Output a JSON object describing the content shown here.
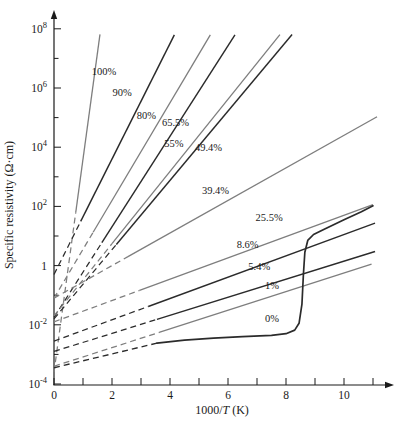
{
  "figure": {
    "background": "#ffffff",
    "axis_color": "#1a1a1a",
    "black_line_color": "#2b2b2b",
    "gray_line_color": "#7e7e7e",
    "label_color": "#1a1a1a"
  },
  "chart_data": {
    "type": "line",
    "title": "",
    "xlabel_parts": {
      "pre": "1000/",
      "italic": "T",
      "post": " (K)"
    },
    "ylabel": "Specific resistivity (Ω·cm)",
    "x_axis": {
      "range": [
        0,
        11.6
      ],
      "labeled_ticks": [
        0,
        2,
        4,
        6,
        8,
        10
      ],
      "minor_ticks": [
        1,
        3,
        5,
        7,
        9,
        11
      ],
      "arrow": true
    },
    "y_axis": {
      "scale": "log10",
      "range_log10": [
        -4,
        8
      ],
      "labeled_ticks": [
        {
          "log10": 8,
          "mantissa": "10",
          "exp": "8"
        },
        {
          "log10": 6,
          "mantissa": "10",
          "exp": "6"
        },
        {
          "log10": 4,
          "mantissa": "10",
          "exp": "4"
        },
        {
          "log10": 2,
          "mantissa": "10",
          "exp": "2"
        },
        {
          "log10": 0,
          "mantissa": "1",
          "exp": ""
        },
        {
          "log10": -2,
          "mantissa": "10",
          "exp": "-2"
        },
        {
          "log10": -4,
          "mantissa": "10",
          "exp": "-4"
        }
      ],
      "minor_ticks_log10": [
        7,
        5,
        3,
        1,
        -1,
        -3
      ],
      "arrow": true
    },
    "series_note": "Arrhenius lines: log10(rho) = intercept_log10 + slope_dec_per_unit * x ; dashed extrapolation from x=0 to solid_from_x, solid from solid_from_x to end_x",
    "series": [
      {
        "name": "100%",
        "intercept_log10": -3.6,
        "slope_dec_per_unit": 7.2,
        "solid_from_x": 0.75,
        "end_x": 1.585,
        "shade": "gray",
        "label": "100%",
        "label_x": 1.3,
        "label_log10": 6.45
      },
      {
        "name": "90%",
        "intercept_log10": -0.3,
        "slope_dec_per_unit": 1.95,
        "solid_from_x": 0.92,
        "end_x": 4.15,
        "shade": "black",
        "label": "90%",
        "label_x": 2.02,
        "label_log10": 5.72
      },
      {
        "name": "80%",
        "intercept_log10": -1.1,
        "slope_dec_per_unit": 1.65,
        "solid_from_x": 1.35,
        "end_x": 5.39,
        "shade": "gray",
        "label": "80%",
        "label_x": 2.85,
        "label_log10": 4.95
      },
      {
        "name": "65.5%",
        "intercept_log10": -1.75,
        "slope_dec_per_unit": 1.53,
        "solid_from_x": 1.65,
        "end_x": 6.24,
        "shade": "black",
        "label": "65.5%",
        "label_x": 3.72,
        "label_log10": 4.7
      },
      {
        "name": "55%",
        "intercept_log10": -1.7,
        "slope_dec_per_unit": 1.22,
        "solid_from_x": 2.0,
        "end_x": 7.79,
        "shade": "gray",
        "label": "55%",
        "label_x": 3.8,
        "label_log10": 4.02
      },
      {
        "name": "49.4%",
        "intercept_log10": -1.8,
        "slope_dec_per_unit": 1.17,
        "solid_from_x": 2.15,
        "end_x": 8.21,
        "shade": "black",
        "label": "49.4%",
        "label_x": 4.86,
        "label_log10": 3.88
      },
      {
        "name": "39.4%",
        "intercept_log10": -1.1,
        "slope_dec_per_unit": 0.55,
        "solid_from_x": 2.55,
        "end_x": 11.14,
        "shade": "gray",
        "label": "39.4%",
        "label_x": 5.1,
        "label_log10": 2.42
      },
      {
        "name": "25.5%",
        "intercept_log10": -1.9,
        "slope_dec_per_unit": 0.36,
        "solid_from_x": 2.95,
        "end_x": 11.0,
        "shade": "gray",
        "label": "25.5%",
        "label_x": 6.95,
        "label_log10": 1.5
      },
      {
        "name": "8.6%",
        "intercept_log10": -2.55,
        "slope_dec_per_unit": 0.36,
        "solid_from_x": 3.25,
        "end_x": 11.07,
        "shade": "black",
        "label": "8.6%",
        "label_x": 6.3,
        "label_log10": 0.6
      },
      {
        "name": "5.4%",
        "intercept_log10": -2.9,
        "slope_dec_per_unit": 0.305,
        "solid_from_x": 3.55,
        "end_x": 11.07,
        "shade": "black",
        "label": "5.4%",
        "label_x": 6.7,
        "label_log10": -0.15
      },
      {
        "name": "1%",
        "intercept_log10": -3.4,
        "slope_dec_per_unit": 0.315,
        "solid_from_x": 3.65,
        "end_x": 10.95,
        "shade": "gray",
        "label": "1%",
        "label_x": 7.28,
        "label_log10": -0.78
      }
    ],
    "curve_0pct": {
      "name": "0%",
      "label": "0%",
      "label_x": 7.28,
      "label_log10": -1.92,
      "shade": "black",
      "dashed_points": [
        [
          0,
          -3.45
        ],
        [
          3.55,
          -2.62
        ]
      ],
      "solid_points": [
        [
          3.55,
          -2.62
        ],
        [
          4.5,
          -2.52
        ],
        [
          5.5,
          -2.45
        ],
        [
          6.5,
          -2.4
        ],
        [
          7.5,
          -2.36
        ],
        [
          8.0,
          -2.3
        ],
        [
          8.3,
          -2.18
        ],
        [
          8.45,
          -1.95
        ],
        [
          8.55,
          -1.3
        ],
        [
          8.6,
          -0.3
        ],
        [
          8.65,
          0.45
        ],
        [
          8.75,
          0.85
        ],
        [
          8.95,
          1.05
        ],
        [
          9.3,
          1.22
        ],
        [
          10.0,
          1.55
        ],
        [
          10.6,
          1.82
        ],
        [
          11.0,
          2.02
        ]
      ]
    },
    "layout": {
      "origin_px": [
        54,
        385
      ],
      "px_per_x_unit": 29,
      "px_per_decade": 29.6,
      "x_axis_end_px": 386,
      "y_axis_top_px": 18
    }
  }
}
